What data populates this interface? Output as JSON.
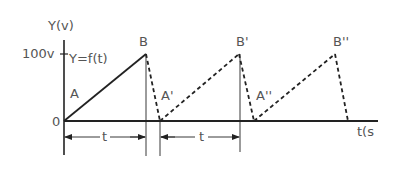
{
  "diagram": {
    "y_axis_label": "Y(v)",
    "x_axis_label": "t(s",
    "y_tick_label": "100v",
    "origin_label": "0",
    "function_label": "Y=f(t)",
    "point_labels": {
      "A": "A",
      "B": "B",
      "A1": "A'",
      "B1": "B'",
      "A2": "A''",
      "B2": "B''"
    },
    "dimension_labels": [
      "t",
      "t"
    ],
    "line_color": "#222222",
    "text_color": "#555555"
  }
}
